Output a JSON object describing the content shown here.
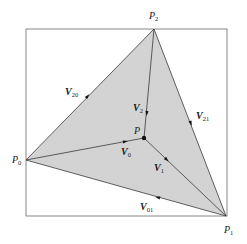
{
  "diagram": {
    "type": "triangle-barycentric-vectors",
    "colors": {
      "fill": "#d3d3d3",
      "stroke": "#3a3a3a",
      "box": "#6a6a6a",
      "point": "#111111",
      "background": "#ffffff"
    },
    "points": {
      "P0": {
        "label": "P",
        "subscript": "0",
        "x": 26,
        "y": 160
      },
      "P1": {
        "label": "P",
        "subscript": "1",
        "x": 226,
        "y": 216
      },
      "P2": {
        "label": "P",
        "subscript": "2",
        "x": 154,
        "y": 29
      },
      "P": {
        "label": "P",
        "subscript": "",
        "x": 144,
        "y": 138
      }
    },
    "vectors": {
      "V20": {
        "label": "V",
        "subscript": "20",
        "from": "P0",
        "to": "P2"
      },
      "V21": {
        "label": "V",
        "subscript": "21",
        "from": "P2",
        "to": "P1"
      },
      "V01": {
        "label": "V",
        "subscript": "01",
        "from": "P1",
        "to": "P0"
      },
      "V0": {
        "label": "V",
        "subscript": "0",
        "from": "P0",
        "to": "P"
      },
      "V1": {
        "label": "V",
        "subscript": "1",
        "from": "P",
        "to": "P1"
      },
      "V2": {
        "label": "V",
        "subscript": "2",
        "from": "P2",
        "to": "P"
      }
    },
    "box": {
      "x": 26,
      "y": 29,
      "width": 201,
      "height": 187
    }
  }
}
